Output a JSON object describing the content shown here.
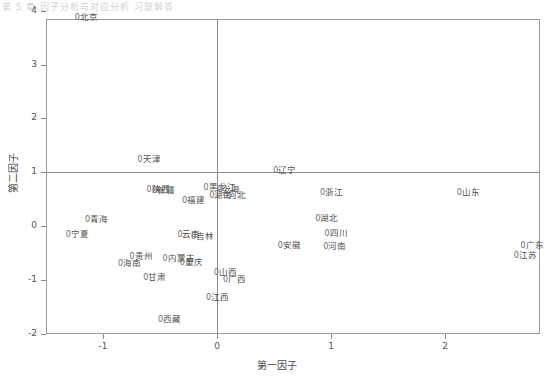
{
  "header_text": "第 5 章 因子分析与对应分析    习题解答",
  "axes": {
    "xlabel": "第一因子",
    "ylabel": "第二因子",
    "xticks": [
      "-1",
      "0",
      "1",
      "2"
    ],
    "yticks": [
      "4",
      "3",
      "2",
      "1",
      "0",
      "-1",
      "-2"
    ]
  },
  "chart_data": {
    "type": "scatter",
    "title": "",
    "xlabel": "第一因子",
    "ylabel": "第二因子",
    "xlim": [
      -1.5,
      2.84
    ],
    "ylim": [
      -2.2,
      4.17
    ],
    "xticks": [
      -1,
      0,
      1,
      2
    ],
    "yticks": [
      4,
      3,
      2,
      1,
      0,
      -1,
      -2
    ],
    "grid": false,
    "legend": "none",
    "marker": "0",
    "reference_lines": {
      "x": 0,
      "y": 1
    },
    "points": [
      {
        "label": "北京",
        "x": -1.23,
        "y": 3.89
      },
      {
        "label": "天津",
        "x": -0.68,
        "y": 1.24
      },
      {
        "label": "辽宁",
        "x": 0.51,
        "y": 1.05
      },
      {
        "label": "陕西",
        "x": -0.6,
        "y": 0.68
      },
      {
        "label": "新疆",
        "x": -0.55,
        "y": 0.66
      },
      {
        "label": "黑龙江",
        "x": -0.1,
        "y": 0.72
      },
      {
        "label": "上海",
        "x": 0.02,
        "y": 0.68
      },
      {
        "label": "湖南",
        "x": -0.05,
        "y": 0.57
      },
      {
        "label": "河北",
        "x": 0.07,
        "y": 0.57
      },
      {
        "label": "浙江",
        "x": 0.92,
        "y": 0.63
      },
      {
        "label": "山东",
        "x": 2.12,
        "y": 0.63
      },
      {
        "label": "福建",
        "x": -0.29,
        "y": 0.48
      },
      {
        "label": "青海",
        "x": -1.14,
        "y": 0.13
      },
      {
        "label": "宁夏",
        "x": -1.31,
        "y": -0.15
      },
      {
        "label": "湖北",
        "x": 0.88,
        "y": 0.15
      },
      {
        "label": "广东",
        "x": 2.68,
        "y": -0.36
      },
      {
        "label": "江苏",
        "x": 2.62,
        "y": -0.53
      },
      {
        "label": "云南",
        "x": -0.33,
        "y": -0.15
      },
      {
        "label": "吉林",
        "x": -0.21,
        "y": -0.18
      },
      {
        "label": "四川",
        "x": 0.96,
        "y": -0.13
      },
      {
        "label": "安徽",
        "x": 0.55,
        "y": -0.35
      },
      {
        "label": "河南",
        "x": 0.95,
        "y": -0.38
      },
      {
        "label": "贵州",
        "x": -0.75,
        "y": -0.55
      },
      {
        "label": "内蒙古",
        "x": -0.46,
        "y": -0.6
      },
      {
        "label": "重庆",
        "x": -0.31,
        "y": -0.66
      },
      {
        "label": "海南",
        "x": -0.85,
        "y": -0.68
      },
      {
        "label": "山西",
        "x": -0.01,
        "y": -0.86
      },
      {
        "label": "广西",
        "x": 0.07,
        "y": -0.98
      },
      {
        "label": "甘肃",
        "x": -0.63,
        "y": -0.94
      },
      {
        "label": "江西",
        "x": -0.08,
        "y": -1.32
      },
      {
        "label": "西藏",
        "x": -0.5,
        "y": -1.73
      }
    ]
  }
}
